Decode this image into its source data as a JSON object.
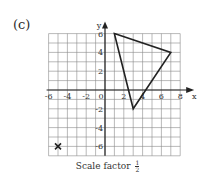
{
  "part_label": "(c)",
  "caption": {
    "text": "Scale factor",
    "fraction_num": "1",
    "fraction_den": "2"
  },
  "axes": {
    "x_label": "x",
    "y_label": "y",
    "x_ticks": [
      "-6",
      "-4",
      "-2",
      "0",
      "2",
      "4",
      "6",
      "8"
    ],
    "y_ticks": [
      "6",
      "4",
      "2",
      "-2",
      "-4",
      "-6"
    ],
    "x_range": [
      -6,
      8
    ],
    "y_range": [
      -7,
      6
    ]
  },
  "shape": {
    "type": "triangle",
    "vertices": [
      [
        1,
        6
      ],
      [
        7,
        4
      ],
      [
        3,
        -2
      ]
    ]
  },
  "centre_of_enlargement": {
    "marker": "cross",
    "point": [
      -5,
      -6
    ]
  },
  "colors": {
    "grid": "#8a8a8a",
    "axis": "#222222",
    "shape": "#222222"
  },
  "chart_data": {
    "type": "scatter",
    "xlabel": "x",
    "ylabel": "y",
    "xlim": [
      -6,
      8
    ],
    "ylim": [
      -7,
      6
    ],
    "grid": true,
    "series": [
      {
        "name": "triangle",
        "points": [
          [
            1,
            6
          ],
          [
            7,
            4
          ],
          [
            3,
            -2
          ]
        ],
        "closed": true
      },
      {
        "name": "centre of enlargement",
        "points": [
          [
            -5,
            -6
          ]
        ],
        "marker": "x"
      }
    ]
  }
}
